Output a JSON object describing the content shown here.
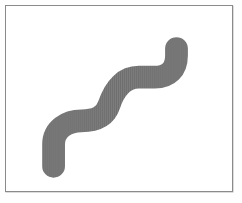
{
  "figure": {
    "width": 242,
    "height": 203,
    "background_color": "#fefefe"
  },
  "frame": {
    "name": "bordered-panel",
    "x": 5,
    "y": 5,
    "width": 228,
    "height": 187,
    "fill_color": "#ffffff",
    "border_color": "#8a8a8a",
    "border_width": 1,
    "shadow_color": "#b9b9b9"
  },
  "shape": {
    "name": "serpentine-curve",
    "description": "Thick gray S-shaped serpentine stroke with rounded end caps running from lower-left to upper-right",
    "fill_color": "#6f6f6f",
    "texture": "fine vertical striations",
    "texture_color": "#7d7d7d",
    "stroke_width": 23,
    "line_cap": "round",
    "line_join": "round",
    "path": "M 48 162 L 48 140 C 48 124 62 116 76 116 C 90 116 100 112 104 100 C 110 82 120 72 134 72 L 150 72 C 164 72 172 64 172 50 L 172 43",
    "points": [
      {
        "x": 48,
        "y": 162
      },
      {
        "x": 48,
        "y": 140
      },
      {
        "x": 76,
        "y": 116
      },
      {
        "x": 104,
        "y": 100
      },
      {
        "x": 134,
        "y": 72
      },
      {
        "x": 150,
        "y": 72
      },
      {
        "x": 172,
        "y": 50
      },
      {
        "x": 172,
        "y": 43
      }
    ],
    "start_cap": {
      "x": 48,
      "y": 162
    },
    "end_cap": {
      "x": 172,
      "y": 43
    }
  }
}
